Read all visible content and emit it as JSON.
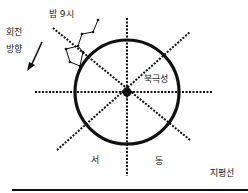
{
  "diagram": {
    "type": "celestial-sphere-sketch",
    "labels": {
      "night_9pm": "밤 9시",
      "rotation_line1": "회전",
      "rotation_line2": "방향",
      "north_star": "북극성",
      "west": "서",
      "east": "동",
      "horizon": "지평선"
    },
    "colors": {
      "ink": "#111111",
      "background": "#ffffff"
    },
    "geometry": {
      "center": [
        127,
        92
      ],
      "circle_radius": 52,
      "horizontal_line": [
        35,
        92,
        213,
        92
      ],
      "vertical_line": [
        127,
        18,
        127,
        176
      ],
      "diagonal_nw_se": [
        53,
        28,
        190,
        140
      ],
      "diagonal_sw_ne": [
        57,
        150,
        190,
        32
      ],
      "horizon_line_y": 190
    }
  }
}
